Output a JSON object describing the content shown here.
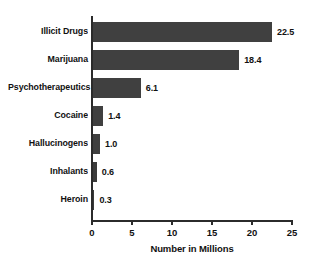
{
  "chart_data": {
    "type": "bar",
    "orientation": "horizontal",
    "title": "",
    "xlabel": "Number in Millions",
    "ylabel": "",
    "xlim": [
      0,
      25
    ],
    "xticks": [
      "0",
      "5",
      "10",
      "15",
      "20",
      "25"
    ],
    "grid": false,
    "legend": null,
    "bar_color": "#404040",
    "categories": [
      "Illicit Drugs",
      "Marijuana",
      "Psychotherapeutics",
      "Cocaine",
      "Hallucinogens",
      "Inhalants",
      "Heroin"
    ],
    "values": [
      22.5,
      18.4,
      6.1,
      1.4,
      1.0,
      0.6,
      0.3
    ],
    "value_labels": [
      "22.5",
      "18.4",
      "6.1",
      "1.4",
      "1.0",
      "0.6",
      "0.3"
    ]
  }
}
